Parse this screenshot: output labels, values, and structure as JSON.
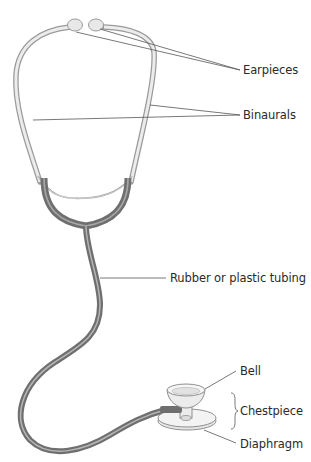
{
  "diagram": {
    "labels": {
      "earpieces": "Earpieces",
      "binaurals": "Binaurals",
      "tubing": "Rubber or plastic tubing",
      "bell": "Bell",
      "chestpiece": "Chestpiece",
      "diaphragm": "Diaphragm"
    },
    "colors": {
      "metal": "#e4e4e4",
      "metal_outline": "#9a9a9a",
      "tubing": "#7d7d7d",
      "tubing_highlight": "#b5b5b5",
      "leader_line": "#555555",
      "text": "#2a2a2a",
      "background": "#ffffff"
    }
  }
}
